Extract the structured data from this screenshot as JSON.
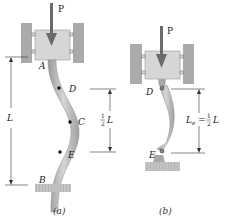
{
  "figure": {
    "colors": {
      "wall": "#a9a9a9",
      "block": "#d4d4d4",
      "column": "#b8b8b8",
      "arrow": "#666666",
      "ground": "#b0b0b0",
      "line": "#333333"
    },
    "panel_a": {
      "load_label": "P",
      "point_A": "A",
      "point_B": "B",
      "point_C": "C",
      "point_D": "D",
      "point_E": "E",
      "length_label": "L",
      "half_length_num": "1",
      "half_length_den": "2",
      "half_length_var": "L",
      "caption": "(a)"
    },
    "panel_b": {
      "load_label": "P",
      "point_D": "D",
      "point_E": "E",
      "eff_length_var": "L",
      "eff_length_sub": "e",
      "eff_length_eq": "=",
      "eff_length_num": "1",
      "eff_length_den": "2",
      "eff_length_L": "L",
      "caption": "(b)"
    }
  }
}
